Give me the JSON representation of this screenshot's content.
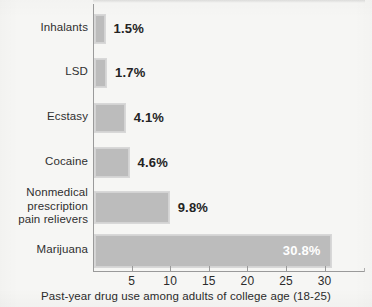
{
  "chart_data": {
    "type": "bar",
    "orientation": "horizontal",
    "title": "",
    "caption": "Past-year drug use among adults of college age (18-25)",
    "xlabel": "",
    "ylabel": "",
    "xlim": [
      0,
      35.2
    ],
    "grid": false,
    "legend": null,
    "categories": [
      "Inhalants",
      "LSD",
      "Ecstasy",
      "Cocaine",
      "Nonmedical\nprescription\npain relievers",
      "Marijuana"
    ],
    "values": [
      1.5,
      1.7,
      4.1,
      4.6,
      9.8,
      30.8
    ],
    "value_labels": [
      "1.5%",
      "1.7%",
      "4.1%",
      "4.6%",
      "9.8%",
      "30.8%"
    ],
    "label_placement": [
      "outside",
      "outside",
      "outside",
      "outside",
      "outside",
      "inside"
    ],
    "xticks": [
      5,
      10,
      15,
      20,
      25,
      30
    ],
    "xtick_labels": [
      "5",
      "10",
      "15",
      "20",
      "25",
      "30"
    ],
    "colors": {
      "bar_fill": "#bcbcbc",
      "bar_border": "#d8d8d8",
      "axis": "#9a9a9a",
      "text": "#2b2b2b",
      "value_text_outside": "#232323",
      "value_text_inside": "#ffffff",
      "background": "#f6f6f4"
    }
  }
}
